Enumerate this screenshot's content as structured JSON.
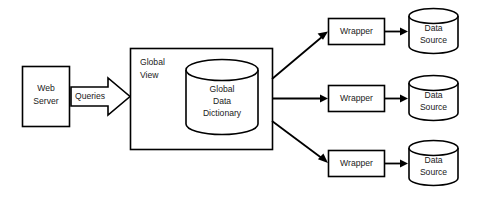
{
  "diagram": {
    "background_color": "#ffffff",
    "line_color": "#000000",
    "text_color": "#1a1a1a",
    "nodes": {
      "web_server": {
        "label_line1": "Web",
        "label_line2": "Server",
        "shape": "rectangle"
      },
      "queries_arrow": {
        "label": "Queries",
        "shape": "block-arrow"
      },
      "global_view": {
        "label_line1": "Global",
        "label_line2": "View",
        "shape": "rectangle"
      },
      "global_data_dictionary": {
        "label_line1": "Global",
        "label_line2": "Data",
        "label_line3": "Dictionary",
        "shape": "cylinder"
      },
      "wrappers": [
        {
          "label": "Wrapper",
          "shape": "rectangle"
        },
        {
          "label": "Wrapper",
          "shape": "rectangle"
        },
        {
          "label": "Wrapper",
          "shape": "rectangle"
        }
      ],
      "data_sources": [
        {
          "label_line1": "Data",
          "label_line2": "Source",
          "shape": "cylinder"
        },
        {
          "label_line1": "Data",
          "label_line2": "Source",
          "shape": "cylinder"
        },
        {
          "label_line1": "Data",
          "label_line2": "Source",
          "shape": "cylinder"
        }
      ]
    },
    "connectors": [
      {
        "from": "web-server",
        "to": "global-view",
        "style": "block-arrow",
        "label": "Queries"
      },
      {
        "from": "global-view",
        "to": "wrapper-1",
        "style": "diagonal-up-arrow",
        "label": ""
      },
      {
        "from": "global-view",
        "to": "wrapper-2",
        "style": "horizontal-arrow",
        "label": ""
      },
      {
        "from": "global-view",
        "to": "wrapper-3",
        "style": "diagonal-down-arrow",
        "label": ""
      },
      {
        "from": "wrapper-1",
        "to": "data-source-1",
        "style": "horizontal-arrow",
        "label": ""
      },
      {
        "from": "wrapper-2",
        "to": "data-source-2",
        "style": "horizontal-arrow",
        "label": ""
      },
      {
        "from": "wrapper-3",
        "to": "data-source-3",
        "style": "horizontal-arrow",
        "label": ""
      }
    ]
  }
}
